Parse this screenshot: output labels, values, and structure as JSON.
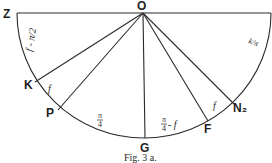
{
  "figure": {
    "caption": "Fig. 3 a.",
    "points": {
      "O": "O",
      "Z": "Z",
      "K": "K",
      "P": "P",
      "G": "G",
      "F": "F",
      "N2": "N₂"
    },
    "angle_labels": {
      "arc_ZK": "f - π/2",
      "arc_right": "k/π",
      "arc_KP": "f",
      "arc_PG_num": "π",
      "arc_PG_den": "4",
      "arc_GF_num": "π",
      "arc_GF_den": "4",
      "arc_GF_suffix": "- f",
      "arc_FN2": "f"
    },
    "colors": {
      "ink": "#2a2a2a",
      "paper": "#ffffff"
    }
  }
}
